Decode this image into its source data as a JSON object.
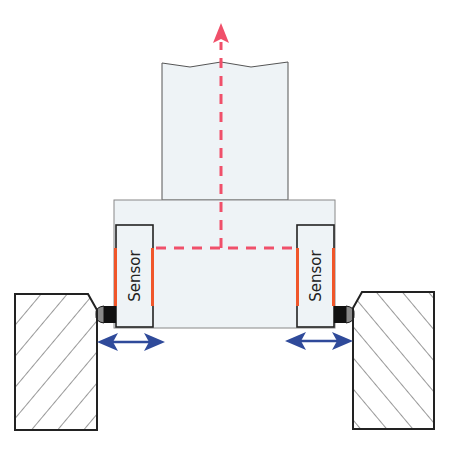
{
  "diagram": {
    "sensors": [
      {
        "id": "left",
        "label": "Sensor"
      },
      {
        "id": "right",
        "label": "Sensor"
      }
    ],
    "colors": {
      "background": "#ffffff",
      "body_fill": "#eef3f6",
      "outline": "#333333",
      "sensor_strip": "#f0562a",
      "dashed_path": "#f0506a",
      "motion_arrow": "#2f4a9a",
      "hatch": "#333333",
      "contact_black": "#111111",
      "contact_gray": "#8a8a8a"
    },
    "icons": {
      "upward_arrow": "arrow-up-icon",
      "motion_arrows": "double-arrow-horizontal-icon"
    }
  }
}
